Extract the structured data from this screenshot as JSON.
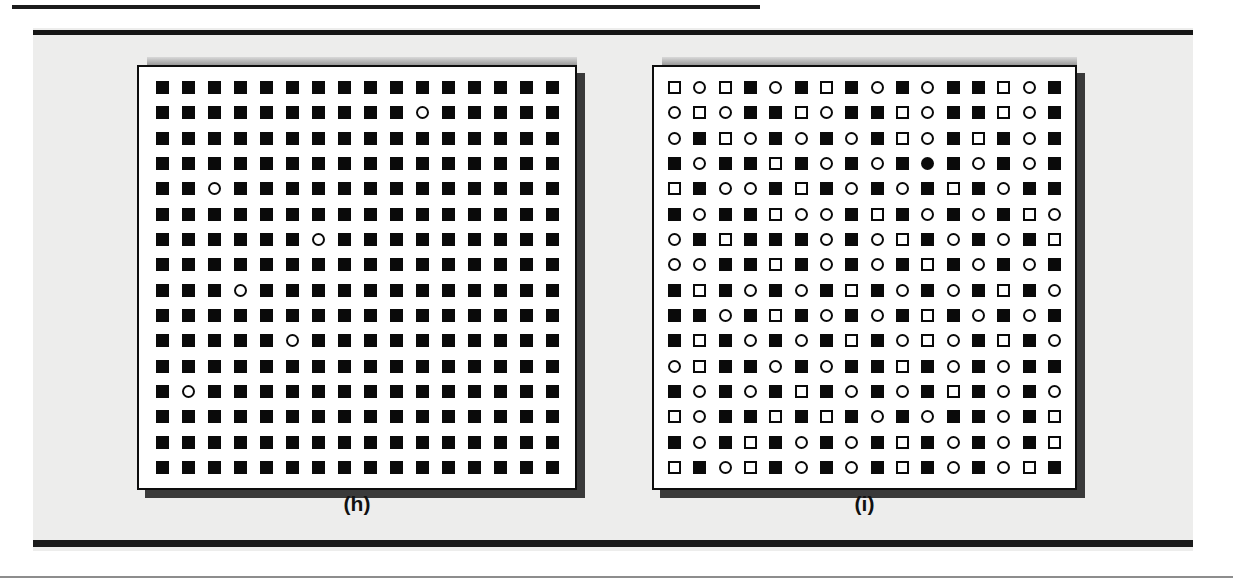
{
  "figure": {
    "background_color": "#ededec",
    "border_color": "#161616",
    "panels": [
      {
        "id": "h",
        "caption": "(h)",
        "rows": 16,
        "cols": 16,
        "symbol_legend": {
          "s": "filled-square",
          "q": "open-square",
          "o": "open-circle",
          "c": "filled-circle"
        },
        "cells": [
          "ssssssssssssssss",
          "ssssssssssosssss",
          "ssssssssssssssss",
          "ssssssssssssssss",
          "ssosssssssssssss",
          "ssssssssssssssss",
          "ssssssosssssssss",
          "ssssssssssssssss",
          "sssossssssssssss",
          "ssssssssssssssss",
          "sssssosssssssss s",
          "ssssssssssssssss",
          "sosssssssssssss s",
          "ssssssssssssssss",
          "ssssssssssssssss",
          "ssssssssssssssss"
        ]
      },
      {
        "id": "i",
        "caption": "(i)",
        "rows": 16,
        "cols": 16,
        "symbol_legend": {
          "s": "filled-square",
          "q": "open-square",
          "o": "open-circle",
          "c": "filled-circle"
        },
        "cells": [
          "qoqsosqsosossqos",
          "oqossqossqossqos",
          "osqosososqosqso",
          "sossqsososcsosos",
          "qsoosqsososqsoss",
          "sossqoosqsososqo",
          "osqsssosoqsososq",
          "oossqsososqsosos",
          "sqsososqsososqso",
          "ssosqsososqsosos",
          "sqsososqsoqosqso",
          "oqssosossqsososs",
          "sososqsososqsoso",
          "qossqsqsosossosq",
          "sosqsososqsososq",
          "qsoqsososqsosoq"
        ]
      }
    ]
  }
}
